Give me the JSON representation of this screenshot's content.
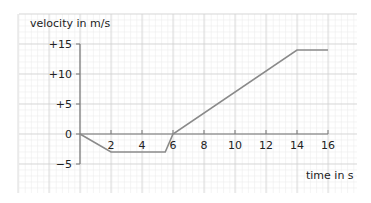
{
  "chart_data": {
    "type": "line",
    "title": "",
    "xlabel": "time in s",
    "ylabel": "velocity in m/s",
    "x_ticks": [
      "2",
      "4",
      "6",
      "8",
      "10",
      "12",
      "14",
      "16"
    ],
    "y_ticks": [
      "+15",
      "+10",
      "+5",
      "0",
      "-5"
    ],
    "xlim": [
      0,
      16
    ],
    "ylim": [
      -5,
      15
    ],
    "grid": true,
    "series": [
      {
        "name": "velocity",
        "x": [
          0,
          2,
          5.5,
          6,
          14,
          16
        ],
        "y": [
          0,
          -3,
          -3,
          0,
          14,
          14
        ]
      }
    ]
  },
  "colors": {
    "line": "#8a8a8a",
    "axis": "#777777",
    "grid_major": "#cfcfcf",
    "grid_minor": "#ececec"
  }
}
